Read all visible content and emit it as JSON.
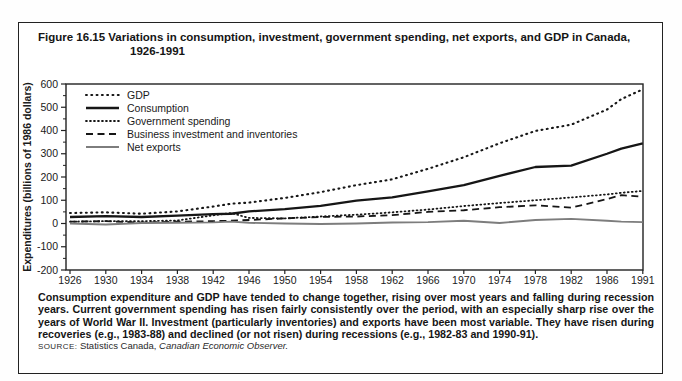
{
  "figure": {
    "title_line1": "Figure 16.15 Variations in consumption, investment, government spending, net exports, and GDP in Canada,",
    "title_line2": "1926-1991"
  },
  "chart_data": {
    "type": "line",
    "title": "Variations in consumption, investment, government spending, net exports, and GDP in Canada, 1926-1991",
    "xlabel": "",
    "ylabel": "Expenditures (billions of 1986 dollars)",
    "ylim": [
      -200,
      600
    ],
    "y_ticks": [
      600,
      500,
      400,
      300,
      200,
      100,
      0,
      -100,
      -200
    ],
    "y_minor_ticks": [
      550,
      450,
      350,
      250,
      150,
      50,
      -50,
      -150
    ],
    "x_tick_labels": [
      "1926",
      "1930",
      "1934",
      "1938",
      "1942",
      "1946",
      "1950",
      "1954",
      "1958",
      "1962",
      "1966",
      "1970",
      "1974",
      "1978",
      "1982",
      "1986",
      "1991"
    ],
    "grid": false,
    "legend_position": "top-left-inside",
    "x": [
      1926,
      1930,
      1934,
      1938,
      1942,
      1944,
      1946,
      1950,
      1954,
      1958,
      1962,
      1966,
      1970,
      1974,
      1978,
      1982,
      1986,
      1988,
      1991
    ],
    "series": [
      {
        "name": "GDP",
        "style": "dotted-large",
        "color": "#161616",
        "values": [
          45,
          48,
          42,
          52,
          73,
          85,
          90,
          110,
          135,
          165,
          190,
          235,
          285,
          345,
          398,
          425,
          490,
          535,
          577
        ]
      },
      {
        "name": "Consumption",
        "style": "solid-thick",
        "color": "#161616",
        "values": [
          28,
          32,
          28,
          34,
          40,
          42,
          52,
          62,
          76,
          98,
          112,
          138,
          165,
          205,
          243,
          249,
          300,
          322,
          345
        ]
      },
      {
        "name": "Government spending",
        "style": "dotted-small",
        "color": "#161616",
        "values": [
          8,
          10,
          10,
          13,
          35,
          45,
          24,
          22,
          30,
          38,
          48,
          60,
          75,
          88,
          100,
          112,
          125,
          132,
          140
        ]
      },
      {
        "name": "Business investment and inventories",
        "style": "dashed",
        "color": "#161616",
        "values": [
          8,
          10,
          4,
          8,
          10,
          12,
          15,
          22,
          28,
          30,
          36,
          50,
          57,
          70,
          78,
          68,
          105,
          122,
          115
        ]
      },
      {
        "name": "Net exports",
        "style": "solid-thin",
        "color": "#7d7d7d",
        "values": [
          0,
          -4,
          2,
          3,
          5,
          8,
          3,
          0,
          -2,
          0,
          4,
          6,
          12,
          2,
          15,
          20,
          12,
          8,
          6
        ]
      }
    ]
  },
  "caption": {
    "text": "Consumption expenditure and GDP have tended to change together, rising over most years and falling during recession years. Current government spending has risen fairly consistently over the period, with an especially sharp rise over the years of World War II. Investment (particularly inventories) and exports have been most variable. They have risen during recoveries (e.g., 1983-88) and declined (or not risen) during recessions (e.g., 1982-83 and 1990-91)."
  },
  "source": {
    "label": "SOURCE:",
    "org": " Statistics Canada, ",
    "publication": "Canadian Economic Observer."
  }
}
